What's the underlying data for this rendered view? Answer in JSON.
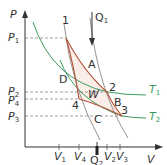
{
  "diagram": {
    "type": "Carnot cycle P-V diagram",
    "axes": {
      "y_label": "P",
      "x_label": "V"
    },
    "pressure_ticks": [
      {
        "label": "P",
        "sub": "1",
        "y": 38
      },
      {
        "label": "P",
        "sub": "2",
        "y": 92
      },
      {
        "label": "P",
        "sub": "4",
        "y": 99
      },
      {
        "label": "P",
        "sub": "3",
        "y": 116
      }
    ],
    "volume_ticks": [
      {
        "label": "V",
        "sub": "1",
        "x": 59
      },
      {
        "label": "V",
        "sub": "4",
        "x": 79
      },
      {
        "label": "V",
        "sub": "2",
        "x": 107
      },
      {
        "label": "V",
        "sub": "3",
        "x": 120
      }
    ],
    "points": [
      {
        "label": "1",
        "x": 66,
        "y": 38
      },
      {
        "label": "2",
        "x": 107,
        "y": 92
      },
      {
        "label": "3",
        "x": 122,
        "y": 116
      },
      {
        "label": "4",
        "x": 79,
        "y": 99
      }
    ],
    "process_labels": [
      "A",
      "B",
      "C",
      "D"
    ],
    "work_label": "W",
    "isotherms": [
      {
        "label": "T",
        "sub": "1",
        "color": "#3a9a5b"
      },
      {
        "label": "T",
        "sub": "2",
        "color": "#3a9a5b"
      }
    ],
    "heat": [
      {
        "label": "Q",
        "sub": "1",
        "direction": "in"
      },
      {
        "label": "Q",
        "sub": "2",
        "direction": "out"
      }
    ],
    "colors": {
      "cycle": "#b5533a",
      "cycle_fill": "#fbeee8",
      "isotherm": "#3a9a5b",
      "axis": "#333333",
      "dashed": "#888888"
    }
  }
}
